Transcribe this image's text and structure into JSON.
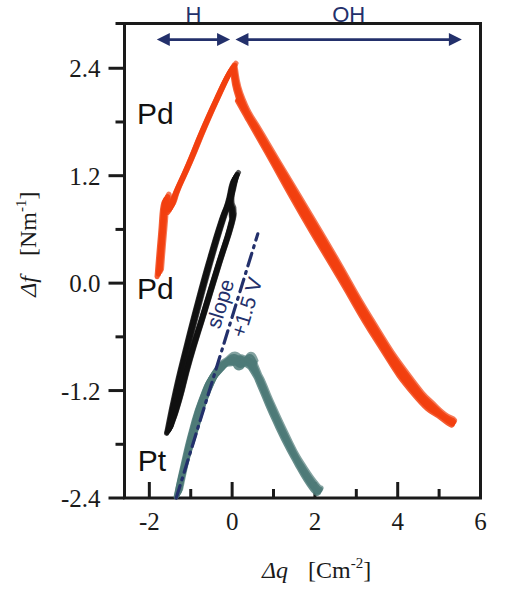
{
  "chart_data": {
    "type": "line",
    "title": "",
    "xlabel": "Δq  [Cm⁻²]",
    "ylabel": "Δf  [Nm⁻¹]",
    "xlim": [
      -2.6,
      6.0
    ],
    "ylim": [
      -2.4,
      2.9
    ],
    "grid": false,
    "legend_position": "inline-annotations",
    "x_ticks_major": [
      "-2",
      "0",
      "2",
      "4",
      "6"
    ],
    "x_ticks_major_values": [
      -2,
      0,
      2,
      4,
      6
    ],
    "x_ticks_minor_values": [
      -1,
      1,
      3,
      5
    ],
    "y_ticks_major": [
      "2.4",
      "1.2",
      "0.0",
      "-1.2",
      "-2.4"
    ],
    "y_ticks_major_values": [
      2.4,
      1.2,
      0.0,
      -1.2,
      -2.4
    ],
    "y_ticks_minor_values": [
      1.8,
      0.6,
      -0.6,
      -1.8
    ],
    "series": [
      {
        "name": "Pd",
        "label": "Pd",
        "color": "#f2400f",
        "description": "Upper red-orange hysteresis loop, peak near (0, 2.4)",
        "points_outbound": [
          [
            -1.78,
            0.1
          ],
          [
            -1.7,
            0.55
          ],
          [
            -1.62,
            0.92
          ],
          [
            -1.52,
            0.82
          ],
          [
            -1.35,
            1.02
          ],
          [
            -1.05,
            1.33
          ],
          [
            -0.7,
            1.72
          ],
          [
            -0.35,
            2.08
          ],
          [
            -0.1,
            2.32
          ],
          [
            0.02,
            2.4
          ]
        ],
        "points_return": [
          [
            0.02,
            2.4
          ],
          [
            0.22,
            2.02
          ],
          [
            0.7,
            1.62
          ],
          [
            1.5,
            1.0
          ],
          [
            2.4,
            0.3
          ],
          [
            3.3,
            -0.42
          ],
          [
            4.2,
            -1.05
          ],
          [
            4.9,
            -1.42
          ],
          [
            5.3,
            -1.55
          ],
          [
            5.1,
            -1.5
          ],
          [
            4.4,
            -1.22
          ],
          [
            3.5,
            -0.62
          ],
          [
            2.6,
            0.08
          ],
          [
            1.7,
            0.78
          ],
          [
            0.85,
            1.48
          ],
          [
            0.15,
            2.05
          ]
        ]
      },
      {
        "name": "Pd",
        "label": "Pd",
        "color": "#111111",
        "description": "Middle black hysteresis loop, peak near (0, 1.15)",
        "points_outbound": [
          [
            -1.55,
            -1.65
          ],
          [
            -1.35,
            -1.2
          ],
          [
            -1.1,
            -0.72
          ],
          [
            -0.8,
            -0.18
          ],
          [
            -0.5,
            0.32
          ],
          [
            -0.25,
            0.7
          ],
          [
            -0.08,
            0.92
          ],
          [
            0.02,
            1.12
          ],
          [
            0.08,
            1.18
          ]
        ],
        "points_return": [
          [
            0.08,
            1.18
          ],
          [
            -0.02,
            1.02
          ],
          [
            -0.05,
            0.88
          ],
          [
            0.0,
            0.78
          ],
          [
            -0.05,
            0.62
          ],
          [
            -0.35,
            0.18
          ],
          [
            -0.7,
            -0.35
          ],
          [
            -1.05,
            -0.88
          ],
          [
            -1.3,
            -1.32
          ],
          [
            -1.48,
            -1.58
          ],
          [
            -1.55,
            -1.65
          ]
        ]
      },
      {
        "name": "Pt",
        "label": "Pt",
        "color": "#4e7a78",
        "description": "Lower teal hysteresis loop, peak near (0.4, -0.85)",
        "points_outbound": [
          [
            -1.32,
            -2.36
          ],
          [
            -1.15,
            -2.0
          ],
          [
            -0.95,
            -1.62
          ],
          [
            -0.72,
            -1.28
          ],
          [
            -0.45,
            -1.02
          ],
          [
            -0.18,
            -0.9
          ],
          [
            0.02,
            -0.85
          ],
          [
            0.2,
            -0.92
          ],
          [
            0.38,
            -0.85
          ],
          [
            0.5,
            -0.92
          ]
        ],
        "points_return": [
          [
            0.5,
            -0.92
          ],
          [
            0.75,
            -1.2
          ],
          [
            1.05,
            -1.52
          ],
          [
            1.4,
            -1.85
          ],
          [
            1.72,
            -2.1
          ],
          [
            2.0,
            -2.28
          ],
          [
            2.1,
            -2.32
          ],
          [
            1.95,
            -2.28
          ],
          [
            1.6,
            -2.02
          ],
          [
            1.25,
            -1.7
          ],
          [
            0.9,
            -1.35
          ],
          [
            0.58,
            -1.02
          ],
          [
            0.3,
            -0.88
          ],
          [
            0.05,
            -0.88
          ],
          [
            -0.25,
            -0.95
          ],
          [
            -0.6,
            -1.22
          ],
          [
            -0.92,
            -1.68
          ],
          [
            -1.18,
            -2.08
          ],
          [
            -1.32,
            -2.36
          ]
        ]
      }
    ],
    "annotations": [
      {
        "name": "slope-line",
        "style": "dash-dot",
        "color": "#23306b",
        "from": [
          -1.35,
          -2.4
        ],
        "to": [
          0.62,
          0.55
        ],
        "label_line1": "slope",
        "label_line2": "+1.5 V"
      },
      {
        "name": "region-H",
        "label": "H",
        "color": "#23306b",
        "from": [
          -1.82,
          2.72
        ],
        "to": [
          -0.05,
          2.72
        ]
      },
      {
        "name": "region-OH",
        "label": "OH",
        "color": "#23306b",
        "from": [
          0.08,
          2.72
        ],
        "to": [
          5.55,
          2.72
        ]
      }
    ]
  },
  "axes": {
    "x_title_symbol": "Δq",
    "x_title_unit_open": "[Cm",
    "x_title_unit_exp": "-2",
    "x_title_unit_close": "]",
    "y_title_symbol": "Δf",
    "y_title_unit_open": "[Nm",
    "y_title_unit_exp": "-1",
    "y_title_unit_close": "]"
  },
  "labels": {
    "region_h": "H",
    "region_oh": "OH",
    "curve_pd_red": "Pd",
    "curve_pd_black": "Pd",
    "curve_pt": "Pt",
    "slope_word": "slope",
    "slope_value": "+1.5 V"
  },
  "colors": {
    "pd_red": "#f2400f",
    "pd_black": "#111111",
    "pt_teal": "#4e7a78",
    "annotation_navy": "#23306b",
    "frame": "#1a1a1a",
    "background": "#ffffff"
  }
}
